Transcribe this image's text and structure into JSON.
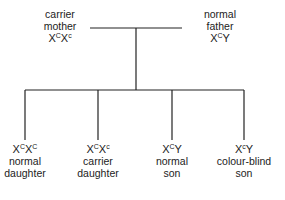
{
  "parents": [
    {
      "role": "carrier",
      "relation": "mother",
      "genotype": {
        "a1": "X",
        "s1": "C",
        "a2": "X",
        "s2": "c"
      }
    },
    {
      "role": "normal",
      "relation": "father",
      "genotype": {
        "a1": "X",
        "s1": "C",
        "a2": "Y",
        "s2": ""
      }
    }
  ],
  "children": [
    {
      "genotype": {
        "a1": "X",
        "s1": "C",
        "a2": "X",
        "s2": "C"
      },
      "line1": "normal",
      "line2": "daughter"
    },
    {
      "genotype": {
        "a1": "X",
        "s1": "C",
        "a2": "X",
        "s2": "c"
      },
      "line1": "carrier",
      "line2": "daughter"
    },
    {
      "genotype": {
        "a1": "X",
        "s1": "C",
        "a2": "Y",
        "s2": ""
      },
      "line1": "normal",
      "line2": "son"
    },
    {
      "genotype": {
        "a1": "X",
        "s1": "c",
        "a2": "Y",
        "s2": ""
      },
      "line1": "colour-blind",
      "line2": "son"
    }
  ],
  "colors": {
    "line": "#222222",
    "text": "#222222",
    "background": "#ffffff"
  }
}
